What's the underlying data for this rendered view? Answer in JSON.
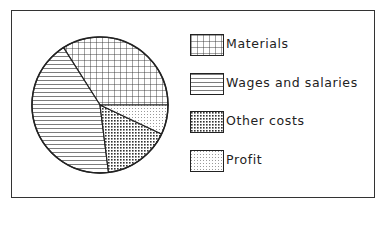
{
  "chart_data": {
    "type": "pie",
    "title": "",
    "categories": [
      "Materials",
      "Wages and salaries",
      "Other costs",
      "Profit"
    ],
    "values": [
      34,
      43,
      16,
      7
    ],
    "unit": "percent (estimated from slice angles)",
    "patterns": [
      "grid",
      "horizontal-lines",
      "dense-dots",
      "light-dots"
    ],
    "legend_position": "right"
  },
  "legend": {
    "items": [
      {
        "label": "Materials"
      },
      {
        "label": "Wages and salaries"
      },
      {
        "label": "Other costs"
      },
      {
        "label": "Profit"
      }
    ]
  }
}
